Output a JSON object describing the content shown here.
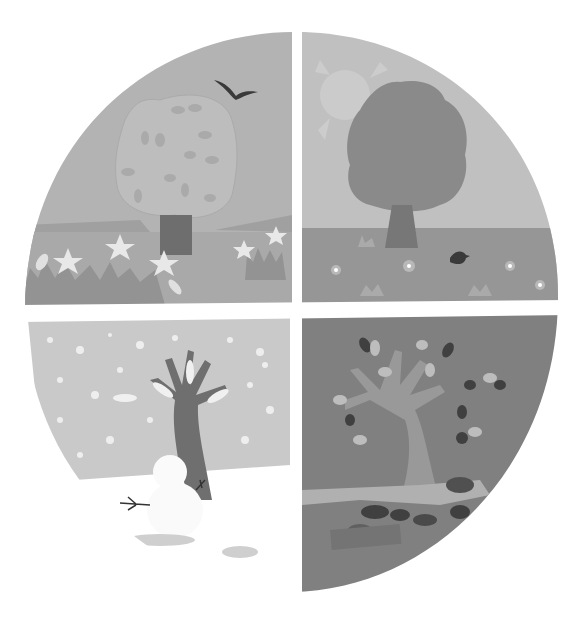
{
  "illustration": {
    "title": "Four seasons",
    "quadrants": [
      {
        "season": "Spring",
        "position": "top-left",
        "elements": [
          "leafy tree",
          "flying bird",
          "white star flowers",
          "grass tufts",
          "distant hills"
        ]
      },
      {
        "season": "Summer",
        "position": "top-right",
        "elements": [
          "sun",
          "full dark tree",
          "small bird on grass",
          "flowers",
          "grass tufts"
        ]
      },
      {
        "season": "Winter",
        "position": "bottom-left",
        "elements": [
          "bare tree with snow",
          "snowman",
          "falling snowflakes",
          "snow ground"
        ]
      },
      {
        "season": "Autumn",
        "position": "bottom-right",
        "elements": [
          "tree with falling leaves",
          "leaf pile on ground"
        ]
      }
    ],
    "colors": {
      "background": "#ffffff",
      "spring_sky": "#b3b3b3",
      "spring_ground": "#a5a5a5",
      "spring_tree": "#bdbdbd",
      "trunk": "#6e6e6e",
      "summer_sky": "#c0c0c0",
      "summer_tree": "#8a8a8a",
      "summer_ground": "#969696",
      "winter_sky": "#c9c9c9",
      "winter_tree": "#6f6f6f",
      "autumn_bg": "#808080",
      "autumn_tree": "#999999",
      "dark_leaf": "#404040",
      "light_leaf": "#bdbdbd",
      "bird": "#3a3a3a"
    }
  }
}
